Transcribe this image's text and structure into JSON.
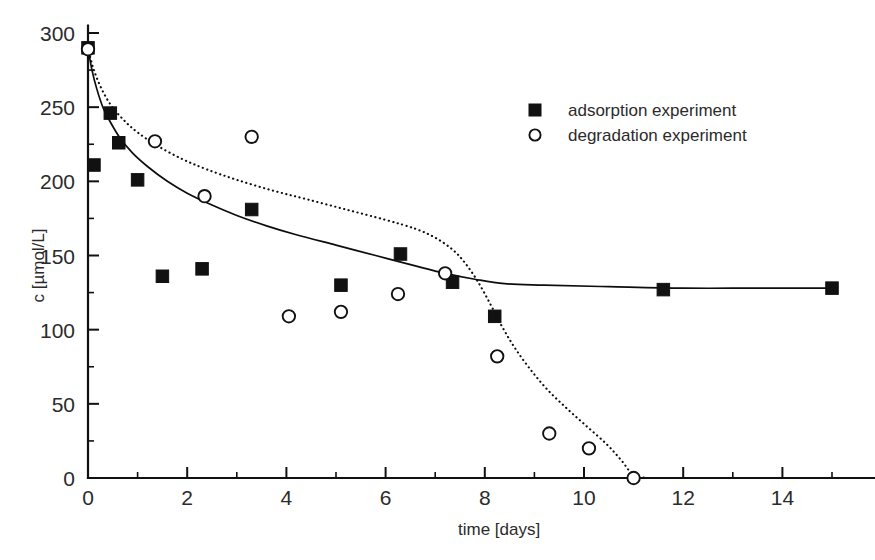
{
  "figure": {
    "kind": "scatter-plot-with-fits",
    "background_color": "#ffffff",
    "foreground_color": "#111111"
  },
  "axes": {
    "x_title": "time [days]",
    "y_title": "c [µmol/L]",
    "x_ticks": [
      "0",
      "2",
      "4",
      "6",
      "8",
      "10",
      "12",
      "14"
    ],
    "y_ticks": [
      "0",
      "50",
      "100",
      "150",
      "200",
      "250",
      "300"
    ]
  },
  "legend": {
    "entries": [
      {
        "marker": "filled-square-marker",
        "label": "adsorption experiment"
      },
      {
        "marker": "open-circle-marker",
        "label": "degradation experiment"
      }
    ]
  },
  "caption_fragment": "",
  "chart_data": {
    "type": "scatter",
    "title": "",
    "xlabel": "time [days]",
    "ylabel": "c [µmol/L]",
    "xlim": [
      -0.35,
      15.85
    ],
    "ylim": [
      -8,
      305
    ],
    "xticks": [
      0,
      2,
      4,
      6,
      8,
      10,
      12,
      14
    ],
    "xticks_minor": [
      1,
      3,
      5,
      7,
      9,
      11,
      13,
      15
    ],
    "yticks": [
      0,
      50,
      100,
      150,
      200,
      250,
      300
    ],
    "yticks_minor": [
      25,
      75,
      125,
      175,
      225,
      275
    ],
    "grid": false,
    "legend_position": "upper-right-inside",
    "series": [
      {
        "name": "adsorption experiment",
        "marker": "filled-square",
        "x": [
          0.0,
          0.12,
          0.45,
          0.62,
          1.0,
          1.5,
          2.3,
          3.3,
          5.1,
          6.3,
          7.35,
          8.2,
          11.6,
          15.0
        ],
        "y": [
          290,
          211,
          246,
          226,
          201,
          136,
          141,
          181,
          130,
          151,
          132,
          109,
          127,
          128
        ]
      },
      {
        "name": "degradation experiment",
        "marker": "open-circle",
        "x": [
          0.0,
          1.35,
          2.35,
          3.3,
          4.05,
          5.1,
          6.25,
          7.2,
          8.25,
          9.3,
          10.1,
          11.0
        ],
        "y": [
          289,
          227,
          190,
          230,
          109,
          112,
          124,
          138,
          82,
          30,
          20,
          0
        ]
      }
    ],
    "fits": [
      {
        "name": "adsorption fit",
        "style": "solid",
        "description": "fast exponential decay from 290 to a plateau near 128",
        "points": [
          [
            0.0,
            290
          ],
          [
            0.08,
            275
          ],
          [
            0.18,
            262
          ],
          [
            0.3,
            250
          ],
          [
            0.45,
            240
          ],
          [
            0.65,
            229
          ],
          [
            0.9,
            219
          ],
          [
            1.2,
            210
          ],
          [
            1.6,
            200
          ],
          [
            2.0,
            192
          ],
          [
            2.5,
            184
          ],
          [
            3.0,
            177
          ],
          [
            3.6,
            170
          ],
          [
            4.2,
            164
          ],
          [
            5.0,
            157
          ],
          [
            5.8,
            150
          ],
          [
            6.6,
            143
          ],
          [
            7.2,
            138
          ],
          [
            7.8,
            134
          ],
          [
            8.4,
            131
          ],
          [
            9.2,
            130
          ],
          [
            10.5,
            129
          ],
          [
            12.0,
            128
          ],
          [
            13.5,
            128
          ],
          [
            15.0,
            128
          ]
        ]
      },
      {
        "name": "degradation fit",
        "style": "dotted",
        "description": "slow decay tracking the adsorption fit then a steep drop to zero at day 11",
        "points": [
          [
            0.0,
            290
          ],
          [
            0.1,
            277
          ],
          [
            0.25,
            264
          ],
          [
            0.45,
            252
          ],
          [
            0.7,
            242
          ],
          [
            1.0,
            233
          ],
          [
            1.4,
            224
          ],
          [
            1.9,
            215
          ],
          [
            2.4,
            208
          ],
          [
            3.0,
            201
          ],
          [
            3.7,
            194
          ],
          [
            4.4,
            188
          ],
          [
            5.2,
            181
          ],
          [
            6.0,
            174
          ],
          [
            6.6,
            168
          ],
          [
            7.0,
            162
          ],
          [
            7.35,
            154
          ],
          [
            7.6,
            145
          ],
          [
            7.85,
            133
          ],
          [
            8.1,
            118
          ],
          [
            8.35,
            102
          ],
          [
            8.6,
            88
          ],
          [
            8.9,
            74
          ],
          [
            9.25,
            60
          ],
          [
            9.65,
            47
          ],
          [
            10.05,
            35
          ],
          [
            10.45,
            23
          ],
          [
            10.75,
            12
          ],
          [
            11.0,
            2
          ],
          [
            11.3,
            0
          ]
        ]
      }
    ]
  }
}
